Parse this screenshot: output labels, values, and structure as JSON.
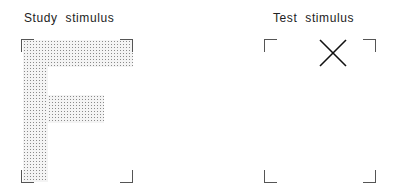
{
  "study_panel": {
    "title": "Study  stimulus",
    "stimulus": "letter-F",
    "fill_pattern": "dotted-gray",
    "fill_color": "#8a8a8a"
  },
  "test_panel": {
    "title": "Test  stimulus",
    "stimulus": "X",
    "stroke_color": "#111111"
  },
  "frame_color": "#555555"
}
